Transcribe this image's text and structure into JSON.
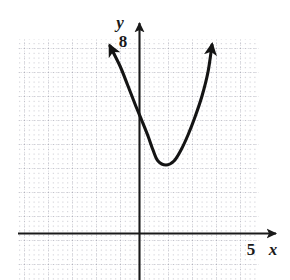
{
  "figure": {
    "caption_fragment": "",
    "background_color": "#ffffff"
  },
  "axes": {
    "x_label": "x",
    "y_label": "y",
    "x_tick_label": "5",
    "y_tick_label": "8",
    "axis_color": "#1a1a1a",
    "grid_color": "#b9b9c4",
    "origin_px": {
      "x": 139,
      "y": 233
    },
    "unit_px": 24,
    "x_axis_arrow": "right",
    "y_axis_arrow": "up"
  },
  "chart_data": {
    "type": "line",
    "title": "",
    "subtitle": "",
    "xlabel": "x",
    "ylabel": "y",
    "grid": true,
    "legend": null,
    "curve_color": "#141414",
    "curve_label": "parabola",
    "arrows": [
      "start",
      "end"
    ],
    "xlim": [
      -5.0,
      5.0
    ],
    "ylim": [
      -4.0,
      8.5
    ],
    "xticks": [
      5
    ],
    "yticks": [
      8
    ],
    "vertex": {
      "x": 0.8,
      "y": 2.9
    },
    "equation_form": "y = a(x - h)^2 + k",
    "a": 0.72,
    "x": [
      -1.2,
      -1.0,
      -0.75,
      -0.5,
      -0.25,
      0.0,
      0.25,
      0.5,
      0.8,
      1.0,
      1.25,
      1.5,
      1.75,
      2.0,
      2.25,
      2.5,
      2.75,
      3.0,
      3.1
    ],
    "y": [
      5.78,
      5.23,
      4.61,
      4.06,
      3.58,
      3.16,
      2.81,
      2.53,
      2.9,
      2.93,
      3.11,
      3.4,
      3.8,
      3.94,
      4.46,
      5.1,
      5.85,
      6.72,
      7.1
    ],
    "points_px": [
      {
        "x": 110,
        "y": 46
      },
      {
        "x": 120,
        "y": 66
      },
      {
        "x": 128,
        "y": 86
      },
      {
        "x": 135,
        "y": 104
      },
      {
        "x": 142,
        "y": 121
      },
      {
        "x": 148,
        "y": 136
      },
      {
        "x": 153,
        "y": 150
      },
      {
        "x": 158,
        "y": 161
      },
      {
        "x": 166,
        "y": 165
      },
      {
        "x": 174,
        "y": 161
      },
      {
        "x": 181,
        "y": 150
      },
      {
        "x": 188,
        "y": 135
      },
      {
        "x": 195,
        "y": 117
      },
      {
        "x": 202,
        "y": 96
      },
      {
        "x": 208,
        "y": 72
      },
      {
        "x": 212,
        "y": 45
      }
    ]
  },
  "grid_geometry": {
    "left_px": 18,
    "right_px": 258,
    "top_px": 39,
    "bottom_px": 280,
    "major_step_px": 24,
    "minor_step_px": 4.8
  }
}
